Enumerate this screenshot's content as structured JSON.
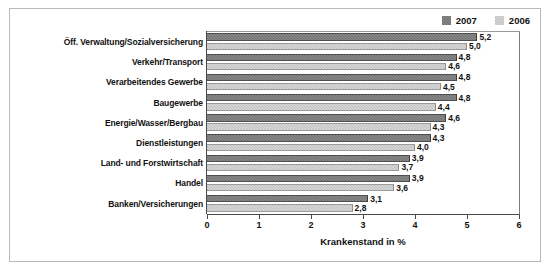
{
  "legend": {
    "entries": [
      {
        "label": "2007",
        "color": "#6e6e6e"
      },
      {
        "label": "2006",
        "color": "#bdbdbd"
      }
    ]
  },
  "axis": {
    "xlabel": "Krankenstand in %",
    "ticks": [
      "0",
      "1",
      "2",
      "3",
      "4",
      "5",
      "6"
    ]
  },
  "chart_data": {
    "type": "bar",
    "orientation": "horizontal",
    "title": "",
    "xlabel": "Krankenstand in %",
    "ylabel": "",
    "xlim": [
      0,
      6
    ],
    "grid": false,
    "legend_position": "top-right",
    "categories": [
      "Öff. Verwaltung/Sozialversicherung",
      "Verkehr/Transport",
      "Verarbeitendes Gewerbe",
      "Baugewerbe",
      "Energie/Wasser/Bergbau",
      "Dienstleistungen",
      "Land- und Forstwirtschaft",
      "Handel",
      "Banken/Versicherungen"
    ],
    "series": [
      {
        "name": "2007",
        "color": "#6e6e6e",
        "values": [
          5.2,
          4.8,
          4.8,
          4.8,
          4.6,
          4.3,
          3.9,
          3.9,
          3.1
        ],
        "labels": [
          "5,2",
          "4,8",
          "4,8",
          "4,8",
          "4,6",
          "4,3",
          "3,9",
          "3,9",
          "3,1"
        ]
      },
      {
        "name": "2006",
        "color": "#bdbdbd",
        "values": [
          5.0,
          4.6,
          4.5,
          4.4,
          4.3,
          4.0,
          3.7,
          3.6,
          2.8
        ],
        "labels": [
          "5,0",
          "4,6",
          "4,5",
          "4,4",
          "4,3",
          "4,0",
          "3,7",
          "3,6",
          "2,8"
        ]
      }
    ]
  }
}
